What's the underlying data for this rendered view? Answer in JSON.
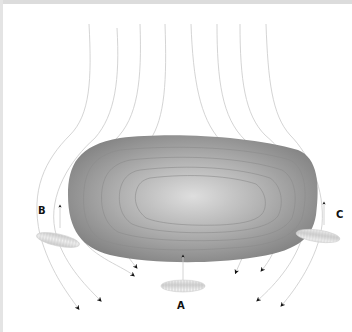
{
  "diagram": {
    "labels": {
      "a": "A",
      "b": "B",
      "c": "C"
    },
    "colors": {
      "body_outer": "#8a8a8a",
      "body_center": "#d6d6d6",
      "flow_line": "#c8c8c8",
      "arrowhead": "#111111",
      "organelle": "#e6e6e6",
      "frame_border": "#dcdcdc"
    },
    "elements": {
      "central_body": "large oval gray body with concentric contour lines",
      "flow_lines_count": 8,
      "organelles": [
        "A",
        "B",
        "C"
      ]
    }
  }
}
